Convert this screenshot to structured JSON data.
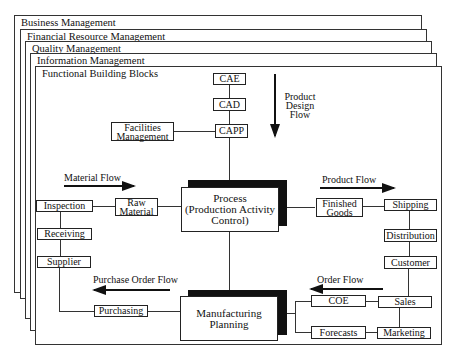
{
  "layers": [
    {
      "title": "Business  Management"
    },
    {
      "title": "Financial Resource Management"
    },
    {
      "title": "Quality Management"
    },
    {
      "title": "Information Management"
    },
    {
      "title": "Functional Building Blocks"
    }
  ],
  "design": {
    "cae": "CAE",
    "cad": "CAD",
    "capp": "CAPP",
    "facilities_line1": "Facilities",
    "facilities_line2": "Management",
    "flow_label_line1": "Product",
    "flow_label_line2": "Design",
    "flow_label_line3": "Flow"
  },
  "process": {
    "line1": "Process",
    "line2": "(Production Activity",
    "line3": "Control)"
  },
  "material": {
    "flow_label": "Material Flow",
    "raw_line1": "Raw",
    "raw_line2": "Material",
    "inspection": "Inspection",
    "receiving": "Receiving",
    "supplier": "Supplier"
  },
  "product": {
    "flow_label": "Product Flow",
    "finished_line1": "Finished",
    "finished_line2": "Goods",
    "shipping": "Shipping",
    "distribution": "Distribution",
    "customer": "Customer"
  },
  "purchase": {
    "flow_label": "Purchase Order Flow",
    "purchasing": "Purchasing"
  },
  "manufacturing": {
    "line1": "Manufacturing",
    "line2": "Planning"
  },
  "order": {
    "flow_label": "Order Flow",
    "coe": "COE",
    "forecasts": "Forecasts",
    "sales": "Sales",
    "marketing": "Marketing"
  }
}
